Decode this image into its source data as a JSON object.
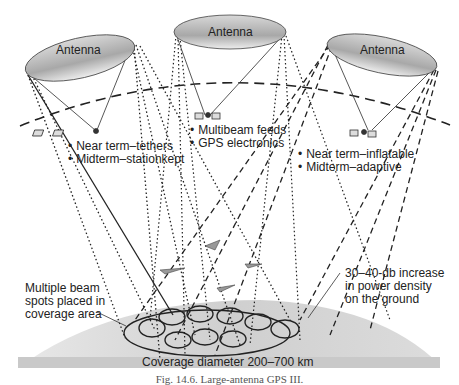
{
  "diagram": {
    "antennas": [
      {
        "label": "Antenna",
        "position": "left"
      },
      {
        "label": "Antenna",
        "position": "center"
      },
      {
        "label": "Antenna",
        "position": "right"
      }
    ],
    "satellite_notes": {
      "left": [
        "Near term–tethers",
        "Midterm–stationkept"
      ],
      "center": [
        "Multibeam feeds",
        "GPS electronics"
      ],
      "right": [
        "Near term–inflatable",
        "Midterm–adaptive"
      ]
    },
    "callouts": {
      "beam_spots": [
        "Multiple beam",
        "spots placed in",
        "coverage area"
      ],
      "power_density": [
        "30–40-db increase",
        "in power density",
        "on the ground"
      ]
    },
    "coverage_label": "Coverage diameter 200–700 km",
    "caption": "Fig. 14.6. Large-antenna GPS III."
  }
}
